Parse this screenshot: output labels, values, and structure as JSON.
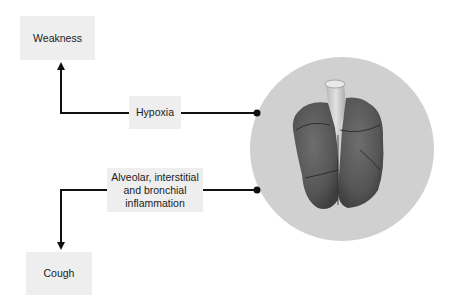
{
  "diagram": {
    "nodes": {
      "weakness": {
        "label": "Weakness"
      },
      "hypoxia": {
        "label": "Hypoxia"
      },
      "inflammation": {
        "label": "Alveolar, interstitial and bronchial inflammation"
      },
      "cough": {
        "label": "Cough"
      }
    },
    "image": {
      "subject": "lungs-illustration"
    },
    "edges": [
      {
        "from": "lungs",
        "to": "hypoxia",
        "style": "dot-line"
      },
      {
        "from": "hypoxia",
        "to": "weakness",
        "style": "arrow"
      },
      {
        "from": "lungs",
        "to": "inflammation",
        "style": "dot-line"
      },
      {
        "from": "inflammation",
        "to": "cough",
        "style": "arrow"
      }
    ],
    "colors": {
      "box_fill": "#eeeeee",
      "circle_fill": "#d0d0d0",
      "line": "#111111",
      "lung": "#5a5a5a"
    }
  }
}
